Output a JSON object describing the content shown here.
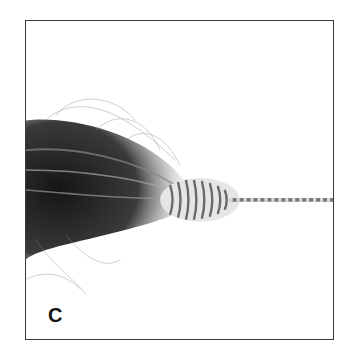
{
  "figure": {
    "panel_label": "C",
    "colors": {
      "frame": "#3a3a3a",
      "hair_dark": "#1a1a1a",
      "hair_mid": "#6b6b6b",
      "wire": "#8a8a8a",
      "background": "#ffffff"
    }
  }
}
